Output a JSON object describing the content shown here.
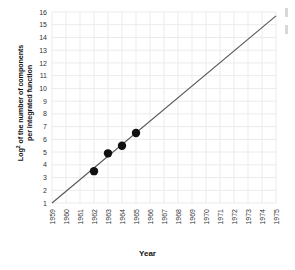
{
  "figure": {
    "xlabel": "Year",
    "ylabel_line1": "Log",
    "ylabel_base": "2",
    "ylabel_line1b": " of the number of components",
    "ylabel_line2": "per integrated function"
  },
  "chart_data": {
    "type": "line",
    "title": "",
    "subtitle": "",
    "xlabel": "Year",
    "ylabel": "Log2 of the number of components per integrated function",
    "x_tick_labels": [
      "1959",
      "1960",
      "1961",
      "1962",
      "1963",
      "1964",
      "1965",
      "1966",
      "1967",
      "1968",
      "1969",
      "1970",
      "1971",
      "1972",
      "1973",
      "1974",
      "1975"
    ],
    "y_tick_labels": [
      "1",
      "2",
      "3",
      "4",
      "5",
      "6",
      "7",
      "8",
      "9",
      "10",
      "11",
      "12",
      "13",
      "14",
      "15",
      "16"
    ],
    "xlim": [
      1959,
      1975
    ],
    "ylim": [
      1,
      16
    ],
    "grid": true,
    "legend": "none",
    "series": [
      {
        "name": "Moore's Law trend line",
        "type": "line",
        "color": "#555555",
        "x": [
          1959,
          1975
        ],
        "y": [
          1.0,
          15.7
        ]
      },
      {
        "name": "Observed data points",
        "type": "scatter",
        "color": "#111111",
        "marker": "circle",
        "x": [
          1962,
          1963,
          1964,
          1965
        ],
        "y": [
          3.5,
          4.9,
          5.5,
          6.5
        ]
      }
    ]
  },
  "style": {
    "grid_color": "#ebebeb",
    "axis_text_color": "#333333",
    "line_color": "#555555",
    "point_color": "#111111",
    "background": "#ffffff"
  }
}
